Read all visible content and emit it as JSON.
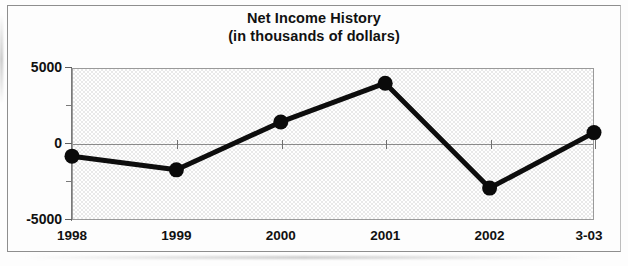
{
  "chart_data": {
    "type": "line",
    "title": "Net Income History",
    "subtitle": "(in thousands of dollars)",
    "xlabel": "",
    "ylabel": "",
    "categories": [
      "1998",
      "1999",
      "2000",
      "2001",
      "2002",
      "3-03"
    ],
    "values": [
      -800,
      -1700,
      1450,
      4000,
      -2900,
      750
    ],
    "series": [
      {
        "name": "Net Income",
        "values": [
          -800,
          -1700,
          1450,
          4000,
          -2900,
          750
        ]
      }
    ],
    "ylim": [
      -5000,
      5000
    ],
    "y_tick_labels": [
      "5000",
      "0",
      "-5000"
    ],
    "y_tick_values": [
      5000,
      0,
      -5000
    ],
    "y_minor_tick_values": [
      2500,
      -2500
    ],
    "grid": "zero-line-only",
    "legend": "none",
    "marker": "filled-circle",
    "line_color": "#0d0d0d",
    "plot_background": "#e9e9e9"
  },
  "axes": {
    "y_labels": [
      {
        "text": "5000",
        "value": 5000
      },
      {
        "text": "0",
        "value": 0
      },
      {
        "text": "-5000",
        "value": -5000
      }
    ],
    "x_labels": [
      {
        "text": "1998"
      },
      {
        "text": "1999"
      },
      {
        "text": "2000"
      },
      {
        "text": "2001"
      },
      {
        "text": "2002"
      },
      {
        "text": "3-03"
      }
    ]
  }
}
